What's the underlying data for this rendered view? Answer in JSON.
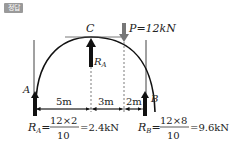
{
  "badge": {
    "label": "정답",
    "color": "#9a9a9a"
  },
  "diagram": {
    "type": "three-hinged arch / semicircular frame reactions",
    "points": {
      "A": "A",
      "B": "B",
      "C": "C"
    },
    "load": {
      "label": "P=12kN"
    },
    "reaction_mid": {
      "symbol": "R",
      "subscript": "A"
    },
    "dimensions": [
      {
        "label": "5m"
      },
      {
        "label": "3m"
      },
      {
        "label": "2m"
      }
    ],
    "equations": {
      "RA": {
        "lhs": "R",
        "lhs_sub": "A",
        "numerator": "12×2",
        "denominator": "10",
        "result": "=2.4kN"
      },
      "RB": {
        "lhs": "R",
        "lhs_sub": "B",
        "numerator": "12×8",
        "denominator": "10",
        "result": "=9.6kN"
      }
    }
  }
}
